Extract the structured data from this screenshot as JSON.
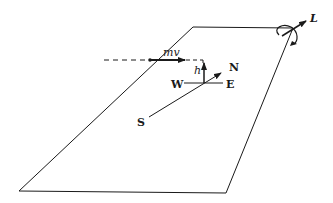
{
  "diagram": {
    "labels": {
      "momentum": "mv",
      "height": "h",
      "west": "W",
      "east": "E",
      "north": "N",
      "south": "S",
      "angular_momentum": "L"
    },
    "colors": {
      "line": "#1a1a1a",
      "background": "#ffffff"
    }
  }
}
